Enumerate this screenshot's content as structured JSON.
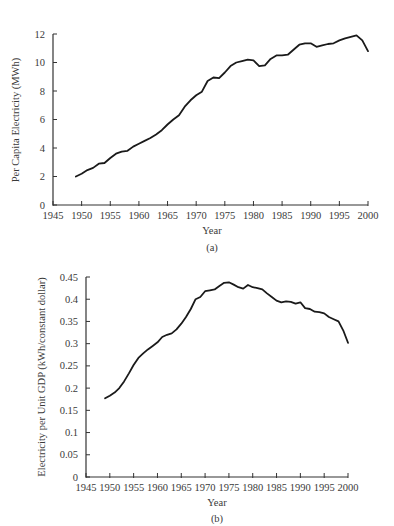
{
  "chart_data": [
    {
      "type": "line",
      "panel_label": "(a)",
      "title": "",
      "xlabel": "Year",
      "ylabel": "Per Capita Electricity (MWh)",
      "xlim": [
        1945,
        2000
      ],
      "ylim": [
        0,
        12
      ],
      "x_ticks": [
        1945,
        1950,
        1955,
        1960,
        1965,
        1970,
        1975,
        1980,
        1985,
        1990,
        1995,
        2000
      ],
      "y_ticks": [
        0,
        2,
        4,
        6,
        8,
        10,
        12
      ],
      "y_tick_labels": [
        "0",
        "2",
        "4",
        "6",
        "8",
        "10",
        "12"
      ],
      "grid": false,
      "legend": null,
      "x": [
        1949,
        1950,
        1951,
        1952,
        1953,
        1954,
        1955,
        1956,
        1957,
        1958,
        1959,
        1960,
        1961,
        1962,
        1963,
        1964,
        1965,
        1966,
        1967,
        1968,
        1969,
        1970,
        1971,
        1972,
        1973,
        1974,
        1975,
        1976,
        1977,
        1978,
        1979,
        1980,
        1981,
        1982,
        1983,
        1984,
        1985,
        1986,
        1987,
        1988,
        1989,
        1990,
        1991,
        1992,
        1993,
        1994,
        1995,
        1996,
        1997,
        1998,
        1999,
        2000
      ],
      "series": [
        {
          "name": "Per capita electricity",
          "values": [
            2.0,
            2.2,
            2.45,
            2.6,
            2.9,
            2.95,
            3.3,
            3.6,
            3.75,
            3.8,
            4.1,
            4.3,
            4.5,
            4.7,
            4.95,
            5.25,
            5.65,
            6.0,
            6.3,
            6.9,
            7.35,
            7.7,
            7.95,
            8.7,
            8.95,
            8.9,
            9.3,
            9.75,
            10.0,
            10.1,
            10.2,
            10.15,
            9.75,
            9.8,
            10.25,
            10.5,
            10.5,
            10.55,
            10.9,
            11.25,
            11.35,
            11.35,
            11.1,
            11.2,
            11.3,
            11.35,
            11.55,
            11.7,
            11.8,
            11.9,
            11.55,
            10.8
          ]
        }
      ]
    },
    {
      "type": "line",
      "panel_label": "(b)",
      "title": "",
      "xlabel": "Year",
      "ylabel": "Electricity per Unit GDP (kWh/constant dollar)",
      "xlim": [
        1945,
        2000
      ],
      "ylim": [
        0,
        0.45
      ],
      "x_ticks": [
        1945,
        1950,
        1955,
        1960,
        1965,
        1970,
        1975,
        1980,
        1985,
        1990,
        1995,
        2000
      ],
      "y_ticks": [
        0,
        0.05,
        0.1,
        0.15,
        0.2,
        0.25,
        0.3,
        0.35,
        0.4,
        0.45
      ],
      "y_tick_labels": [
        "0",
        "0.05",
        "0.1",
        "0.15",
        "0.2",
        "0.25",
        "0.3",
        "0.35",
        "0.4",
        "0.45"
      ],
      "grid": false,
      "legend": null,
      "x": [
        1949,
        1950,
        1951,
        1952,
        1953,
        1954,
        1955,
        1956,
        1957,
        1958,
        1959,
        1960,
        1961,
        1962,
        1963,
        1964,
        1965,
        1966,
        1967,
        1968,
        1969,
        1970,
        1971,
        1972,
        1973,
        1974,
        1975,
        1976,
        1977,
        1978,
        1979,
        1980,
        1981,
        1982,
        1983,
        1984,
        1985,
        1986,
        1987,
        1988,
        1989,
        1990,
        1991,
        1992,
        1993,
        1994,
        1995,
        1996,
        1997,
        1998,
        1999,
        2000
      ],
      "series": [
        {
          "name": "Electricity per unit GDP",
          "values": [
            0.177,
            0.183,
            0.19,
            0.2,
            0.215,
            0.233,
            0.252,
            0.268,
            0.278,
            0.287,
            0.295,
            0.303,
            0.315,
            0.32,
            0.323,
            0.332,
            0.345,
            0.36,
            0.378,
            0.4,
            0.405,
            0.418,
            0.42,
            0.422,
            0.43,
            0.437,
            0.438,
            0.433,
            0.427,
            0.424,
            0.432,
            0.427,
            0.425,
            0.422,
            0.413,
            0.405,
            0.397,
            0.393,
            0.395,
            0.394,
            0.39,
            0.393,
            0.38,
            0.378,
            0.372,
            0.371,
            0.368,
            0.36,
            0.355,
            0.35,
            0.33,
            0.302
          ]
        }
      ]
    }
  ],
  "panels": {
    "a": {
      "xlabel": "Year",
      "ylabel": "Per Capita Electricity (MWh)",
      "caption": "(a)"
    },
    "b": {
      "xlabel": "Year",
      "ylabel": "Electricity per Unit GDP (kWh/constant dollar)",
      "caption": "(b)"
    }
  }
}
